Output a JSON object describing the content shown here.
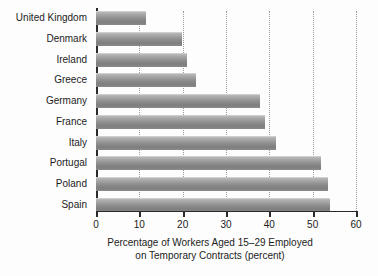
{
  "chart_data": {
    "type": "bar",
    "orientation": "horizontal",
    "title": "",
    "xlabel": "Percentage of Workers Aged 15–29 Employed on Temporary Contracts (percent)",
    "xlabel_line1": "Percentage of Workers Aged 15–29 Employed",
    "xlabel_line2": "on Temporary Contracts (percent)",
    "ylabel": "",
    "categories": [
      "United Kingdom",
      "Denmark",
      "Ireland",
      "Greece",
      "Germany",
      "France",
      "Italy",
      "Portugal",
      "Poland",
      "Spain"
    ],
    "values": [
      11.5,
      19.8,
      21.0,
      23.0,
      37.8,
      39.0,
      41.5,
      52.0,
      53.5,
      54.0
    ],
    "xlim": [
      0,
      60
    ],
    "xticks": [
      0,
      10,
      20,
      30,
      40,
      50,
      60
    ],
    "xtick_labels": [
      "0",
      "10",
      "20",
      "30",
      "40",
      "50",
      "60"
    ],
    "grid": "vertical-dotted",
    "legend": "none",
    "bar_color_top": "#b9b9b9",
    "bar_color_bottom": "#7e7e7e",
    "axis_color": "#2b2b2b",
    "gridline_color": "#9a9a9a",
    "background": "#fdfdfd"
  }
}
